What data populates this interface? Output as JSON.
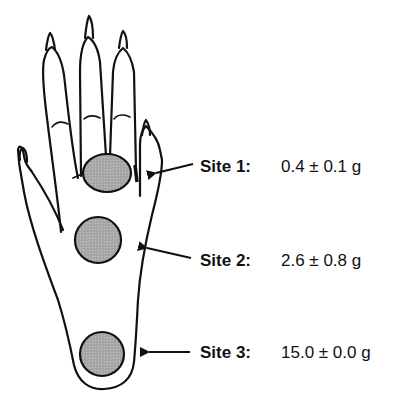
{
  "figure": {
    "type": "hand-diagram",
    "colors": {
      "outline": "#111111",
      "site_fill": "#a8a8a8",
      "background": "#ffffff"
    }
  },
  "sites": [
    {
      "name": "Site 1:",
      "value": "0.4 ± 0.1 g"
    },
    {
      "name": "Site 2:",
      "value": "2.6 ± 0.8 g"
    },
    {
      "name": "Site 3:",
      "value": "15.0 ± 0.0 g"
    }
  ]
}
